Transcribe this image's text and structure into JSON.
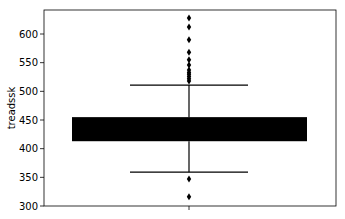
{
  "chart_data": {
    "type": "box",
    "title": "",
    "xlabel": "",
    "ylabel": "treadssk",
    "ylim": [
      300,
      640
    ],
    "yticks": [
      300,
      350,
      400,
      450,
      500,
      550,
      600
    ],
    "grid": false,
    "legend": null,
    "series": [
      {
        "name": "treadssk",
        "whisker_low": 359,
        "q1": 413,
        "q3": 455,
        "whisker_high": 511,
        "box_color": "#000000",
        "outliers_high": [
          518,
          522,
          526,
          530,
          533,
          537,
          546,
          555,
          568,
          590,
          612,
          628
        ],
        "outliers_low": [
          347,
          316
        ]
      }
    ]
  },
  "colors": {
    "box": "#000000",
    "spine": "#000000",
    "background": "#ffffff"
  }
}
